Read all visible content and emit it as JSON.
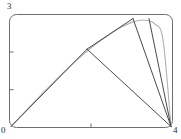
{
  "figure": {
    "title": "",
    "labels": {
      "y_max": "3",
      "origin": "0",
      "x_max": "4"
    }
  },
  "chart_data": {
    "type": "line",
    "title": "",
    "xlabel": "",
    "ylabel": "",
    "xlim": [
      0,
      4
    ],
    "ylim": [
      0,
      3
    ],
    "grid": false,
    "legend": false,
    "x_ticks": [
      0,
      2,
      4
    ],
    "x_tick_labels": [
      "0",
      "",
      "4"
    ],
    "y_ticks": [
      0,
      1,
      2,
      3
    ],
    "y_tick_labels": [
      "0",
      "",
      "",
      "3"
    ],
    "frame": {
      "style": "rounded-box",
      "color": "#6e6e6e",
      "corner_radius": 0.18
    },
    "series": [
      {
        "name": "curve",
        "type": "line",
        "color": "#b0b0b0",
        "width": 1.1,
        "smooth": true,
        "x": [
          0.0,
          0.2,
          0.4,
          0.6,
          0.8,
          1.0,
          1.2,
          1.4,
          1.6,
          1.8,
          2.0,
          2.2,
          2.4,
          2.6,
          2.8,
          3.0,
          3.2,
          3.4,
          3.6,
          3.8,
          4.0
        ],
        "y": [
          0.0,
          0.23,
          0.46,
          0.69,
          0.91,
          1.13,
          1.35,
          1.56,
          1.76,
          1.95,
          2.13,
          2.3,
          2.45,
          2.6,
          2.72,
          2.82,
          2.88,
          2.88,
          2.78,
          2.35,
          0.0
        ]
      },
      {
        "name": "chord-origin-to-mid",
        "type": "segment",
        "color": "#4a4a4a",
        "width": 1.0,
        "x": [
          0.0,
          1.9
        ],
        "y": [
          0.0,
          2.1
        ]
      },
      {
        "name": "chord-mid-to-peak",
        "type": "segment",
        "color": "#4a4a4a",
        "width": 1.0,
        "x": [
          1.9,
          3.05
        ],
        "y": [
          2.1,
          2.93
        ]
      },
      {
        "name": "chord-mid-to-xmax",
        "type": "segment",
        "color": "#4a4a4a",
        "width": 1.0,
        "x": [
          1.9,
          4.0
        ],
        "y": [
          2.1,
          0.0
        ]
      },
      {
        "name": "chord-peak-to-xmax",
        "type": "segment",
        "color": "#4a4a4a",
        "width": 1.0,
        "x": [
          3.05,
          4.0
        ],
        "y": [
          2.93,
          0.0
        ]
      },
      {
        "name": "chord-topright-to-xmax",
        "type": "segment",
        "color": "#4a4a4a",
        "width": 1.0,
        "x": [
          3.45,
          4.0
        ],
        "y": [
          2.93,
          0.0
        ]
      }
    ],
    "vertices": [
      {
        "name": "origin",
        "x": 0.0,
        "y": 0.0
      },
      {
        "name": "mid-node",
        "x": 1.9,
        "y": 2.1
      },
      {
        "name": "peak-node",
        "x": 3.05,
        "y": 2.93
      },
      {
        "name": "x-max-node",
        "x": 4.0,
        "y": 0.0
      }
    ]
  }
}
